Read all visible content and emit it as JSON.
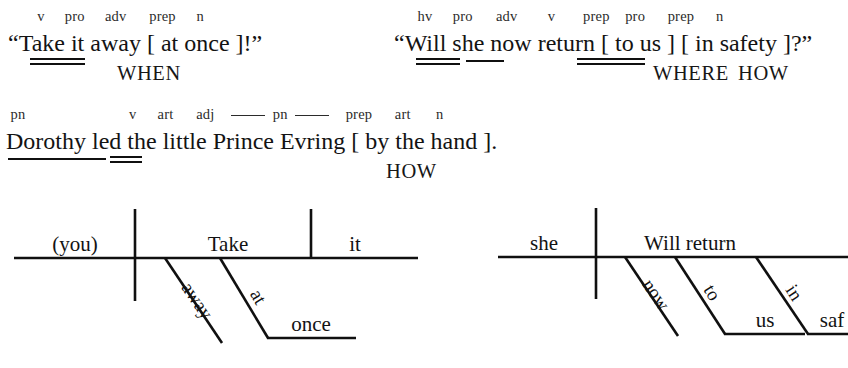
{
  "page": {
    "kind": "sentence-diagramming-worksheet",
    "background": "#ffffff",
    "ink": "#101010"
  },
  "sentences": [
    {
      "id": "sentence-1",
      "text": "“Take it away [ at once ]!”",
      "pos_labels": [
        "v",
        "pro",
        "adv",
        "prep",
        "n"
      ],
      "tokens": [
        "“Take",
        "it",
        "away",
        "[",
        "at",
        "once",
        "]!”"
      ],
      "question_words": [
        "WHEN"
      ]
    },
    {
      "id": "sentence-2",
      "text": "“Will she now return [ to us ]  [ in safety ]?”",
      "pos_labels": [
        "hv",
        "pro",
        "adv",
        "v",
        "prep",
        "pro",
        "prep",
        "n"
      ],
      "tokens": [
        "“Will",
        "she",
        "now",
        "return",
        "[ to us ]",
        "[ in safety ]?”"
      ],
      "question_words": [
        "WHERE",
        "HOW"
      ]
    },
    {
      "id": "sentence-3",
      "text": "Dorothy led the little Prince Evring [ by the hand ].",
      "pos_labels": [
        "pn",
        "v",
        "art",
        "adj",
        "pn",
        "prep",
        "art",
        "n"
      ],
      "pn_label_dashed": "pn",
      "tokens": [
        "Dorothy",
        "led",
        "the",
        "little",
        "Prince",
        "Evring",
        "[",
        "by",
        "the",
        "hand",
        "]."
      ],
      "question_words": [
        "HOW"
      ]
    }
  ],
  "diagrams": [
    {
      "id": "diagram-1",
      "subject": "(you)",
      "verb": "Take",
      "direct_object": "it",
      "modifiers": [
        {
          "word": "away",
          "type": "adverb-slant"
        },
        {
          "word": "at",
          "type": "preposition-slant"
        },
        {
          "word": "once",
          "type": "object-of-preposition"
        }
      ]
    },
    {
      "id": "diagram-2",
      "subject": "she",
      "verb": "Will return",
      "direct_object": "",
      "modifiers": [
        {
          "word": "now",
          "type": "adverb-slant"
        },
        {
          "word": "to",
          "type": "preposition-slant"
        },
        {
          "word": "us",
          "type": "object-of-preposition"
        },
        {
          "word": "in",
          "type": "preposition-slant"
        },
        {
          "word": "saf",
          "type": "object-of-preposition-clipped"
        }
      ]
    }
  ]
}
